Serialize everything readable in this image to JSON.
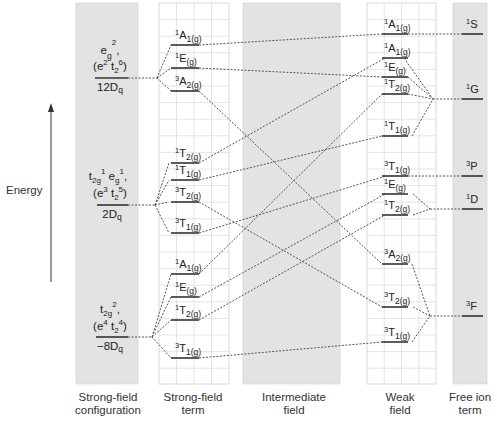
{
  "axis": {
    "label": "Energy",
    "arrow": "up"
  },
  "columns": [
    {
      "id": "strong-config",
      "line1": "Strong-field",
      "line2": "configuration"
    },
    {
      "id": "strong-term",
      "line1": "Strong-field",
      "line2": "term"
    },
    {
      "id": "intermediate",
      "line1": "Intermediate",
      "line2": "field"
    },
    {
      "id": "weak",
      "line1": "Weak",
      "line2": "field"
    },
    {
      "id": "free-ion",
      "line1": "Free ion",
      "line2": "term"
    }
  ],
  "configurations": [
    {
      "id": "eg2",
      "line1": "e_g^2,",
      "line2": "(e^2 t_2^6)",
      "energy": "12Dq"
    },
    {
      "id": "t2g1eg1",
      "line1": "t_2g^1 e_g^1,",
      "line2": "(e^3 t_2^5)",
      "energy": "2Dq"
    },
    {
      "id": "t2g2",
      "line1": "t_2g^2,",
      "line2": "(e^4 t_2^4)",
      "energy": "−8Dq"
    }
  ],
  "config_text": {
    "eg2": {
      "a": "e",
      "a_sub": "g",
      "a_sup": "2",
      "tail": ",",
      "paren": "(e",
      "p1": "2",
      "mid": " t",
      "p2sub": "2",
      "p2": "6",
      "close": ")",
      "energy": "12D",
      "energy_sub": "q"
    },
    "t2g1eg1": {
      "a": "t",
      "a_sub": "2g",
      "a_sup": "1",
      "b": " e",
      "b_sub": "g",
      "b_sup": "1",
      "tail": ",",
      "paren": "(e",
      "p1": "3",
      "mid": " t",
      "p2sub": "2",
      "p2": "5",
      "close": ")",
      "energy": "2D",
      "energy_sub": "q"
    },
    "t2g2": {
      "a": "t",
      "a_sub": "2g",
      "a_sup": "2",
      "tail": ",",
      "paren": "(e",
      "p1": "4",
      "mid": " t",
      "p2sub": "2",
      "p2": "4",
      "close": ")",
      "energy": "−8D",
      "energy_sub": "q"
    }
  },
  "strong_field_terms": [
    {
      "config": "eg2",
      "mult": "1",
      "sym": "A",
      "idx": "1(g)",
      "y": 45
    },
    {
      "config": "eg2",
      "mult": "1",
      "sym": "E",
      "idx": "(g)",
      "y": 68
    },
    {
      "config": "eg2",
      "mult": "3",
      "sym": "A",
      "idx": "2(g)",
      "y": 91
    },
    {
      "config": "t2g1eg1",
      "mult": "1",
      "sym": "T",
      "idx": "2(g)",
      "y": 163
    },
    {
      "config": "t2g1eg1",
      "mult": "1",
      "sym": "T",
      "idx": "1(g)",
      "y": 180
    },
    {
      "config": "t2g1eg1",
      "mult": "3",
      "sym": "T",
      "idx": "2(g)",
      "y": 202
    },
    {
      "config": "t2g1eg1",
      "mult": "3",
      "sym": "T",
      "idx": "1(g)",
      "y": 233
    },
    {
      "config": "t2g2",
      "mult": "1",
      "sym": "A",
      "idx": "1(g)",
      "y": 274
    },
    {
      "config": "t2g2",
      "mult": "1",
      "sym": "E",
      "idx": "(g)",
      "y": 297
    },
    {
      "config": "t2g2",
      "mult": "1",
      "sym": "T",
      "idx": "2(g)",
      "y": 320
    },
    {
      "config": "t2g2",
      "mult": "3",
      "sym": "T",
      "idx": "1(g)",
      "y": 358
    }
  ],
  "weak_field_terms": [
    {
      "parent": "1S",
      "mult": "1",
      "sym": "A",
      "idx": "1(g)",
      "y": 34
    },
    {
      "parent": "1G",
      "mult": "1",
      "sym": "A",
      "idx": "1(g)",
      "y": 58
    },
    {
      "parent": "1G",
      "mult": "1",
      "sym": "E",
      "idx": "(g)",
      "y": 77
    },
    {
      "parent": "1G",
      "mult": "1",
      "sym": "T",
      "idx": "2(g)",
      "y": 94
    },
    {
      "parent": "1G",
      "mult": "1",
      "sym": "T",
      "idx": "1(g)",
      "y": 136
    },
    {
      "parent": "3P",
      "mult": "3",
      "sym": "T",
      "idx": "1(g)",
      "y": 176
    },
    {
      "parent": "1D",
      "mult": "1",
      "sym": "E",
      "idx": "(g)",
      "y": 194
    },
    {
      "parent": "1D",
      "mult": "1",
      "sym": "T",
      "idx": "2(g)",
      "y": 215
    },
    {
      "parent": "3F",
      "mult": "3",
      "sym": "A",
      "idx": "2(g)",
      "y": 264
    },
    {
      "parent": "3F",
      "mult": "3",
      "sym": "T",
      "idx": "2(g)",
      "y": 307
    },
    {
      "parent": "3F",
      "mult": "3",
      "sym": "T",
      "idx": "1(g)",
      "y": 342
    }
  ],
  "free_ion_terms": [
    {
      "mult": "1",
      "sym": "S",
      "y": 34
    },
    {
      "mult": "1",
      "sym": "G",
      "y": 99
    },
    {
      "mult": "3",
      "sym": "P",
      "y": 176
    },
    {
      "mult": "1",
      "sym": "D",
      "y": 209
    },
    {
      "mult": "3",
      "sym": "F",
      "y": 316
    }
  ],
  "correlations": [
    {
      "from": "1A1(g) [e_g^2]",
      "to": "1A1(g) [1S]"
    },
    {
      "from": "1E(g) [e_g^2]",
      "to": "1E(g) [1G]"
    },
    {
      "from": "3A2(g) [e_g^2]",
      "to": "3A2(g) [3F]"
    },
    {
      "from": "1T2(g) [t2g1eg1]",
      "to": "1A1(g) [1G]"
    },
    {
      "from": "1T1(g) [t2g1eg1]",
      "to": "1T1(g) [1G]"
    },
    {
      "from": "3T2(g) [t2g1eg1]",
      "to": "3T2(g) [3F]"
    },
    {
      "from": "3T1(g) [t2g1eg1]",
      "to": "3T1(g) [3P]"
    },
    {
      "from": "1A1(g) [t2g2]",
      "to": "1T2(g) [1G]"
    },
    {
      "from": "1E(g) [t2g2]",
      "to": "1E(g) [1D]"
    },
    {
      "from": "1T2(g) [t2g2]",
      "to": "1T2(g) [1D]"
    },
    {
      "from": "3T1(g) [t2g2]",
      "to": "3T1(g) [3F]"
    }
  ],
  "caption_partial": "(caption text cut off at bottom edge)"
}
